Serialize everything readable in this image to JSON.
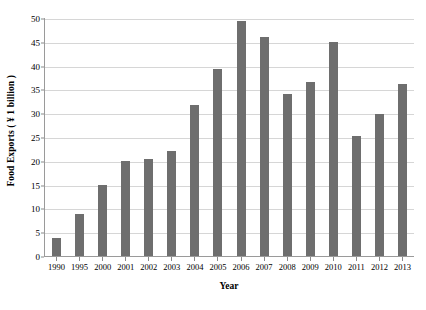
{
  "chart_data": {
    "type": "bar",
    "title": "",
    "xlabel": "Year",
    "ylabel": "Food Exports ( ¥ 1 billion )",
    "categories": [
      "1990",
      "1995",
      "2000",
      "2001",
      "2002",
      "2003",
      "2004",
      "2005",
      "2006",
      "2007",
      "2008",
      "2009",
      "2010",
      "2011",
      "2012",
      "2013"
    ],
    "values": [
      3.8,
      8.8,
      15.0,
      19.9,
      20.4,
      22.0,
      31.8,
      39.3,
      49.3,
      46.1,
      34.0,
      36.6,
      45.0,
      25.3,
      29.8,
      36.2
    ],
    "ylim": [
      0,
      50
    ],
    "ytick_step": 5,
    "yticks": [
      "50",
      "45",
      "40",
      "35",
      "30",
      "25",
      "20",
      "15",
      "10",
      "5",
      "0"
    ],
    "ytick_values": [
      50,
      45,
      40,
      35,
      30,
      25,
      20,
      15,
      10,
      5,
      0
    ],
    "grid": true,
    "legend": false,
    "bar_color": "#6e6e6e",
    "gridline_color": "#d6d6d6",
    "axis_color": "#9a9a9a",
    "background_color": "#ffffff"
  }
}
